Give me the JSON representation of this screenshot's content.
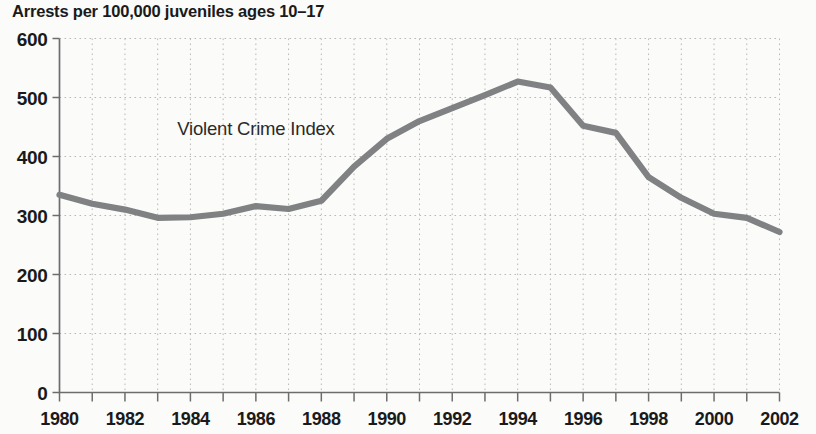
{
  "chart_data": {
    "type": "line",
    "title": "Arrests per 100,000 juveniles ages 10–17",
    "xlabel": "",
    "ylabel": "",
    "ylim": [
      0,
      600
    ],
    "xlim": [
      1980,
      2002
    ],
    "yticks": [
      0,
      100,
      200,
      300,
      400,
      500,
      600
    ],
    "ytick_labels": [
      "0",
      "100",
      "200",
      "300",
      "400",
      "500",
      "600"
    ],
    "xticks": [
      1980,
      1981,
      1982,
      1983,
      1984,
      1985,
      1986,
      1987,
      1988,
      1989,
      1990,
      1991,
      1992,
      1993,
      1994,
      1995,
      1996,
      1997,
      1998,
      1999,
      2000,
      2001,
      2002
    ],
    "xtick_labels_shown": [
      "1980",
      "1982",
      "1984",
      "1986",
      "1988",
      "1990",
      "1992",
      "1994",
      "1996",
      "1998",
      "2000",
      "2002"
    ],
    "grid": true,
    "legend": "none",
    "annotations": [
      {
        "text": "Violent Crime Index",
        "x": 1983.6,
        "y": 437
      }
    ],
    "x": [
      1980,
      1981,
      1982,
      1983,
      1984,
      1985,
      1986,
      1987,
      1988,
      1989,
      1990,
      1991,
      1992,
      1993,
      1994,
      1995,
      1996,
      1997,
      1998,
      1999,
      2000,
      2001,
      2002
    ],
    "series": [
      {
        "name": "Violent Crime Index",
        "color": "#7f8183",
        "values": [
          335,
          320,
          310,
          296,
          297,
          303,
          316,
          311,
          325,
          383,
          430,
          460,
          482,
          504,
          527,
          517,
          452,
          440,
          365,
          330,
          303,
          296,
          272
        ]
      }
    ]
  },
  "style": {
    "background": "#fbfbfa",
    "line_color": "#7f8183",
    "grid_color": "#b9b9b5",
    "axis_color": "#6d6d6d",
    "text_color": "#1a1a1a"
  }
}
